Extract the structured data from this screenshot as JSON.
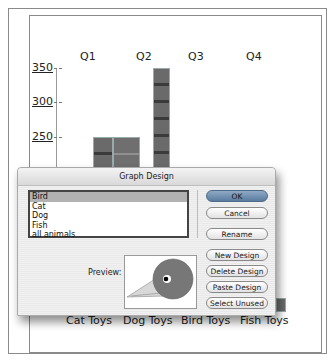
{
  "dialog": {
    "title": "Graph Design",
    "designs": [
      {
        "label": "Bird",
        "selected": true
      },
      {
        "label": "Cat",
        "selected": false
      },
      {
        "label": "Dog",
        "selected": false
      },
      {
        "label": "Fish",
        "selected": false
      },
      {
        "label": "all animals",
        "selected": false
      }
    ],
    "buttons": {
      "ok": "OK",
      "cancel": "Cancel",
      "rename": "Rename",
      "new_design": "New Design",
      "delete_design": "Delete Design",
      "paste_design": "Paste Design",
      "select_unused": "Select Unused"
    },
    "preview_label": "Preview:"
  },
  "graph": {
    "quarters": [
      "Q1",
      "Q2",
      "Q3",
      "Q4"
    ],
    "y_ticks": [
      "350",
      "300",
      "250"
    ],
    "categories": [
      "Cat Toys",
      "Dog Toys",
      "Bird Toys",
      "Fish Toys"
    ]
  },
  "colors": {
    "bird_body": "#777777",
    "default_button": "#6a8aad",
    "selection_highlight": "#b2b2b2"
  }
}
